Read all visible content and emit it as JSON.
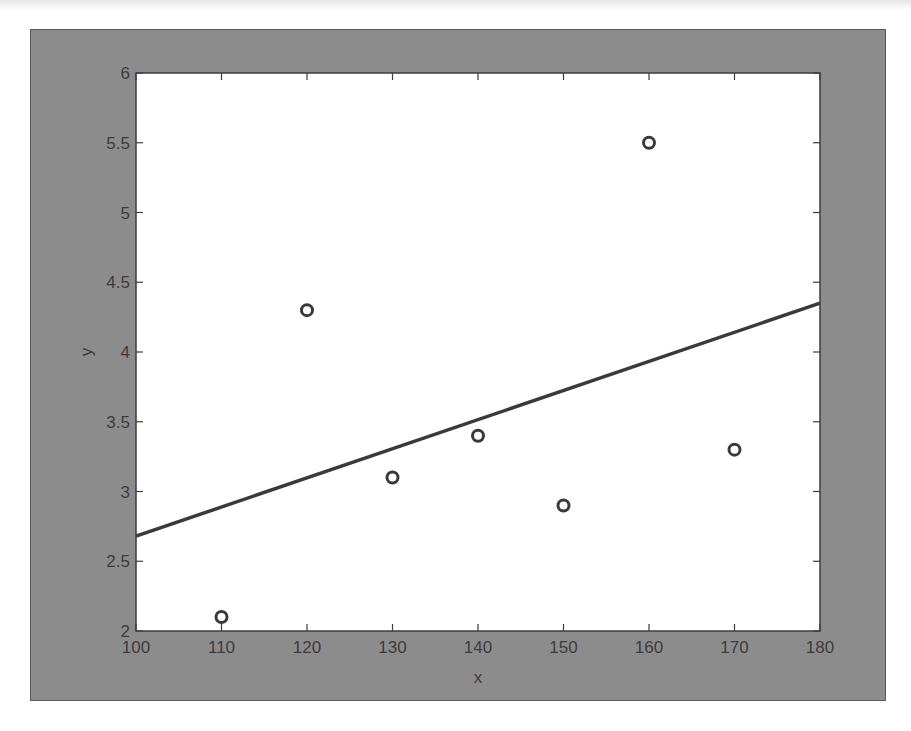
{
  "colors": {
    "figure_bg": "#8c8c8c",
    "axes_bg": "#ffffff",
    "axis_color": "#3c3c3c",
    "marker_color": "#3a3a3a",
    "line_color": "#3a3a3a"
  },
  "chart_data": {
    "type": "scatter",
    "title": "",
    "xlabel": "x",
    "ylabel": "y",
    "xlim": [
      100,
      180
    ],
    "ylim": [
      2,
      6
    ],
    "grid": false,
    "legend": null,
    "xticks": [
      "100",
      "110",
      "120",
      "130",
      "140",
      "150",
      "160",
      "170",
      "180"
    ],
    "yticks": [
      "2",
      "2.5",
      "3",
      "3.5",
      "4",
      "4.5",
      "5",
      "5.5",
      "6"
    ],
    "series": [
      {
        "name": "data",
        "style": "open-circle markers",
        "x": [
          110,
          120,
          130,
          140,
          150,
          160,
          170
        ],
        "y": [
          2.1,
          4.3,
          3.1,
          3.4,
          2.9,
          5.5,
          3.3
        ]
      },
      {
        "name": "least-squares fit",
        "style": "solid line",
        "x": [
          100,
          180
        ],
        "y": [
          2.68,
          4.35
        ]
      }
    ]
  }
}
